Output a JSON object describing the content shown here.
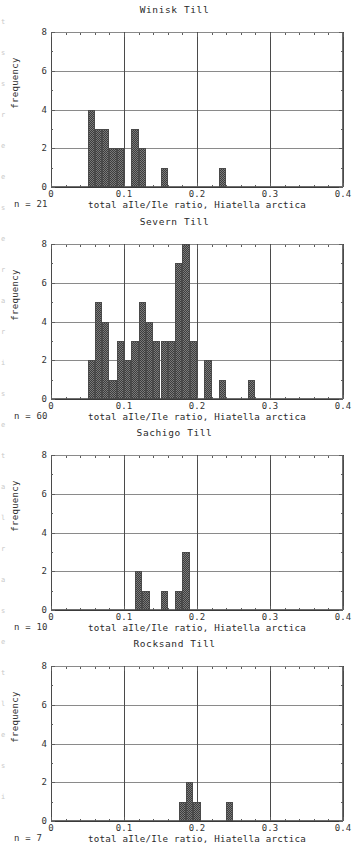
{
  "figure": {
    "panel_count": 4,
    "y_axis_title": "frequency",
    "x_axis_title": "total aIle/Ile ratio, Hiatella arctica",
    "y_ticks": [
      "0",
      "2",
      "4",
      "6",
      "8"
    ],
    "x_ticks": [
      "0",
      "0.1",
      "0.2",
      "0.3",
      "0.4"
    ],
    "bar_fill_color": "#4a4a4a",
    "grid_color": "#8a8a8a"
  },
  "panels": [
    {
      "title": "Winisk Till",
      "n_label": "n = 21",
      "chart_data": {
        "type": "bar",
        "title": "Winisk Till",
        "xlabel": "total aIle/Ile ratio, Hiatella arctica",
        "ylabel": "frequency",
        "xlim": [
          0,
          0.4
        ],
        "ylim": [
          0,
          8
        ],
        "grid": true,
        "bin_width": 0.01,
        "bin_starts": [
          0.05,
          0.06,
          0.07,
          0.08,
          0.09,
          0.11,
          0.12,
          0.15,
          0.23
        ],
        "values": [
          4,
          3,
          3,
          2,
          2,
          3,
          2,
          1,
          1
        ],
        "n": 21
      }
    },
    {
      "title": "Severn Till",
      "n_label": "n = 60",
      "chart_data": {
        "type": "bar",
        "title": "Severn Till",
        "xlabel": "total aIle/Ile ratio, Hiatella arctica",
        "ylabel": "frequency",
        "xlim": [
          0,
          0.4
        ],
        "ylim": [
          0,
          8
        ],
        "grid": true,
        "bin_width": 0.01,
        "bin_starts": [
          0.05,
          0.06,
          0.07,
          0.08,
          0.09,
          0.1,
          0.11,
          0.12,
          0.13,
          0.14,
          0.15,
          0.16,
          0.17,
          0.18,
          0.19,
          0.21,
          0.23,
          0.27
        ],
        "values": [
          2,
          5,
          4,
          1,
          3,
          2,
          3,
          5,
          4,
          3,
          3,
          3,
          7,
          8,
          3,
          2,
          1,
          1
        ],
        "n": 60
      }
    },
    {
      "title": "Sachigo Till",
      "n_label": "n = 10",
      "chart_data": {
        "type": "bar",
        "title": "Sachigo Till",
        "xlabel": "total aIle/Ile ratio, Hiatella arctica",
        "ylabel": "frequency",
        "xlim": [
          0,
          0.4
        ],
        "ylim": [
          0,
          8
        ],
        "grid": true,
        "bin_width": 0.01,
        "bin_starts": [
          0.115,
          0.125,
          0.15,
          0.17,
          0.18
        ],
        "values": [
          2,
          1,
          1,
          1,
          3
        ],
        "n": 10
      }
    },
    {
      "title": "Rocksand Till",
      "n_label": "n = 7",
      "chart_data": {
        "type": "bar",
        "title": "Rocksand Till",
        "xlabel": "total aIle/Ile ratio, Hiatella arctica",
        "ylabel": "frequency",
        "xlim": [
          0,
          0.4
        ],
        "ylim": [
          0,
          8
        ],
        "grid": true,
        "bin_width": 0.01,
        "bin_starts": [
          0.175,
          0.185,
          0.195,
          0.24
        ],
        "values": [
          1,
          2,
          1,
          1
        ],
        "n": 7
      }
    }
  ],
  "edge_marks": [
    "t",
    "s",
    "s",
    "r",
    "e",
    "e",
    "s",
    "e",
    "r",
    "a",
    "r",
    "i",
    "s",
    "e",
    "t",
    "a",
    "l",
    "r",
    "a",
    "s",
    "e",
    "t",
    "l",
    "e",
    "s",
    "i"
  ]
}
